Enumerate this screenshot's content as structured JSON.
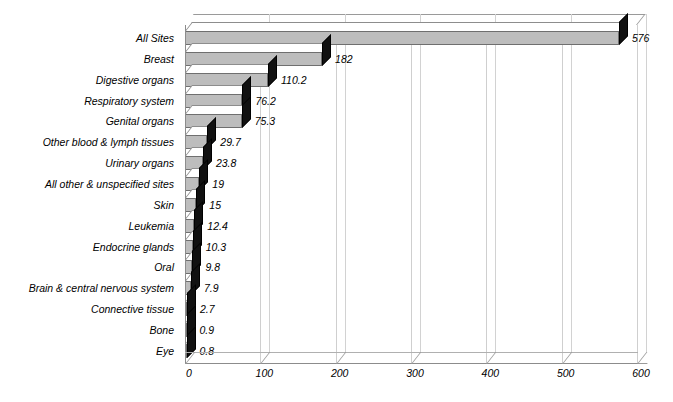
{
  "chart_data": {
    "type": "bar",
    "orientation": "horizontal",
    "title": "",
    "subtitle": "",
    "xlabel": "",
    "ylabel": "",
    "xlim": [
      0,
      600
    ],
    "xticks": [
      0,
      100,
      200,
      300,
      400,
      500,
      600
    ],
    "xtick_labels": [
      "0",
      "100",
      "200",
      "300",
      "400",
      "500",
      "600"
    ],
    "grid": true,
    "legend": false,
    "style": "3d-horizontal-bar",
    "categories": [
      "All Sites",
      "Breast",
      "Digestive organs",
      "Respiratory system",
      "Genital organs",
      "Other blood & lymph tissues",
      "Urinary organs",
      "All other & unspecified sites",
      "Skin",
      "Leukemia",
      "Endocrine glands",
      "Oral",
      "Brain & central nervous system",
      "Connective tissue",
      "Bone",
      "Eye"
    ],
    "values": [
      576,
      182,
      110.2,
      76.2,
      75.3,
      29.7,
      23.8,
      19,
      15,
      12.4,
      10.3,
      9.8,
      7.9,
      2.7,
      0.9,
      0.8
    ],
    "value_labels": [
      "576",
      "182",
      "110.2",
      "76.2",
      "75.3",
      "29.7",
      "23.8",
      "19",
      "15",
      "12.4",
      "10.3",
      "9.8",
      "7.9",
      "2.7",
      "0.9",
      "0.8"
    ],
    "colors": {
      "bar_front": "#bdbdbd",
      "bar_cap": "#111111",
      "bar_top": "#ffffff",
      "bar_outline": "#6f6f6f",
      "gridline": "#d2d2d2",
      "axis": "#8c8c8c",
      "text": "#000000",
      "background": "#ffffff"
    }
  }
}
